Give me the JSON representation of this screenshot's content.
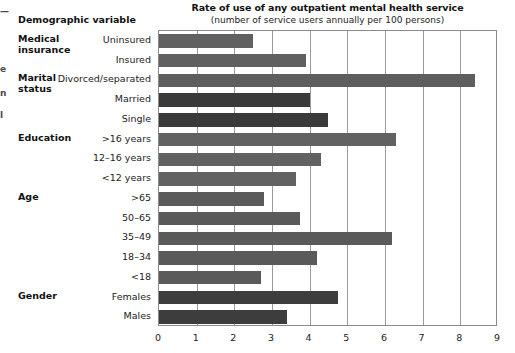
{
  "header": {
    "column_header": "Demographic variable"
  },
  "chart_data": {
    "type": "bar",
    "orientation": "horizontal",
    "title": "Rate of use of any outpatient mental health service",
    "subtitle": "(number of service users annually per 100 persons)",
    "xlabel": "",
    "ylabel": "Demographic variable",
    "xlim": [
      0,
      9
    ],
    "xticks": [
      "0",
      "1",
      "2",
      "3",
      "4",
      "5",
      "6",
      "7",
      "8",
      "9"
    ],
    "grid": true,
    "legend": "none",
    "categories": [
      "Uninsured",
      "Insured",
      "Divorced/separated",
      "Married",
      "Single",
      ">16 years",
      "12–16 years",
      "<12 years",
      ">65",
      "50–65",
      "35–49",
      "18–34",
      "<18",
      "Females",
      "Males"
    ],
    "values": [
      2.5,
      3.9,
      8.4,
      4.0,
      4.5,
      6.3,
      4.3,
      3.65,
      2.8,
      3.75,
      6.2,
      4.2,
      2.7,
      4.75,
      3.4
    ],
    "groups": [
      {
        "label": "Medical\ninsurance",
        "start_row": 0,
        "count": 2
      },
      {
        "label": "Marital\nstatus",
        "start_row": 2,
        "count": 3
      },
      {
        "label": "Education",
        "start_row": 5,
        "count": 3
      },
      {
        "label": "Age",
        "start_row": 8,
        "count": 5
      },
      {
        "label": "Gender",
        "start_row": 13,
        "count": 2
      }
    ],
    "bar_colors": [
      "#606060",
      "#606060",
      "#5e5e5e",
      "#3a3a3a",
      "#3a3a3a",
      "#626262",
      "#626262",
      "#626262",
      "#5a5a5a",
      "#5a5a5a",
      "#5a5a5a",
      "#5a5a5a",
      "#5a5a5a",
      "#3d3d3d",
      "#3d3d3d"
    ]
  },
  "rows": [
    {
      "category": "Uninsured",
      "value": 2.5,
      "group": "Medical\ninsurance",
      "group_first": true
    },
    {
      "category": "Insured",
      "value": 3.9,
      "group": "",
      "group_first": false
    },
    {
      "category": "Divorced/separated",
      "value": 8.4,
      "group": "Marital\nstatus",
      "group_first": true
    },
    {
      "category": "Married",
      "value": 4.0,
      "group": "",
      "group_first": false
    },
    {
      "category": "Single",
      "value": 4.5,
      "group": "",
      "group_first": false
    },
    {
      "category": ">16 years",
      "value": 6.3,
      "group": "Education",
      "group_first": true
    },
    {
      "category": "12–16 years",
      "value": 4.3,
      "group": "",
      "group_first": false
    },
    {
      "category": "<12 years",
      "value": 3.65,
      "group": "",
      "group_first": false
    },
    {
      "category": ">65",
      "value": 2.8,
      "group": "Age",
      "group_first": true
    },
    {
      "category": "50–65",
      "value": 3.75,
      "group": "",
      "group_first": false
    },
    {
      "category": "35–49",
      "value": 6.2,
      "group": "",
      "group_first": false
    },
    {
      "category": "18–34",
      "value": 4.2,
      "group": "",
      "group_first": false
    },
    {
      "category": "<18",
      "value": 2.7,
      "group": "",
      "group_first": false
    },
    {
      "category": "Females",
      "value": 4.75,
      "group": "Gender",
      "group_first": true
    },
    {
      "category": "Males",
      "value": 3.4,
      "group": "",
      "group_first": false
    }
  ],
  "edge_fragments": [
    {
      "text": "—",
      "top": 6
    },
    {
      "text": "e",
      "top": 64
    },
    {
      "text": "n",
      "top": 88
    },
    {
      "text": "l",
      "top": 110
    }
  ],
  "colors": {
    "bar_light": "#606060",
    "bar_dark": "#3a3a3a",
    "frame": "#8a8a8a",
    "grid": "#9a9a9a",
    "text": "#222222"
  }
}
